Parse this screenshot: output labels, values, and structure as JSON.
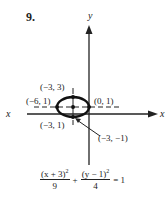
{
  "problem_number": "9.",
  "axes": {
    "x_label": "x",
    "y_label": "y"
  },
  "points": {
    "top": "(−3, 3)",
    "left": "(−6, 1)",
    "right": "(0, 1)",
    "center": "(−3, 1)",
    "bottom": "(−3, −1)"
  },
  "equation": {
    "term1_numerator": "(x + 3)",
    "term1_exponent": "2",
    "term1_denominator": "9",
    "plus": "+",
    "term2_numerator": "(y − 1)",
    "term2_exponent": "2",
    "term2_denominator": "4",
    "equals": "= 1"
  }
}
